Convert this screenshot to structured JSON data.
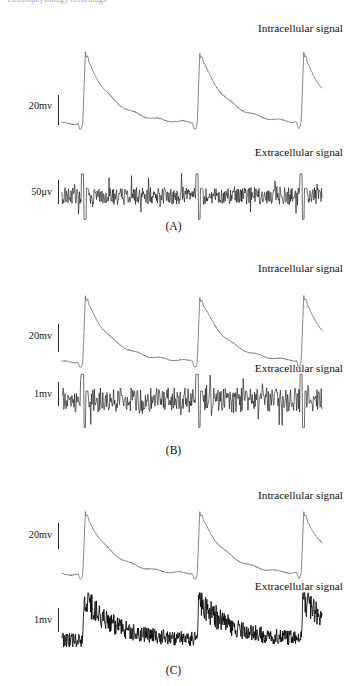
{
  "running_head": "electrophysiology recordings",
  "labels": {
    "intracellular": "Intracellular signal",
    "extracellular": "Extracellular signal"
  },
  "panels": [
    {
      "caption": "(A)",
      "intra": {
        "label": "Intracellular signal",
        "scale": "20mv"
      },
      "extra": {
        "label": "Extracellular signal",
        "scale": "50μv",
        "style": "spiky-noise"
      }
    },
    {
      "caption": "(B)",
      "intra": {
        "label": "Intracellular signal",
        "scale": "20mv"
      },
      "extra": {
        "label": "Extracellular signal",
        "scale": "1mv",
        "style": "spiky-noise"
      }
    },
    {
      "caption": "(C)",
      "intra": {
        "label": "Intracellular signal",
        "scale": "20mv"
      },
      "extra": {
        "label": "Extracellular signal",
        "scale": "1mv",
        "style": "burst-envelope"
      }
    }
  ],
  "chart_data": {
    "type": "line",
    "title": "",
    "xlabel": "",
    "ylabel": "",
    "grid": false,
    "legend": "none",
    "series": [
      {
        "name": "A-intracellular",
        "panel": "A",
        "kind": "intracellular",
        "scale_bar": "20mv",
        "burst_onsets_pct": [
          8,
          52,
          92
        ],
        "peak_amplitude_rel": 1.0,
        "baseline_rel": 0.0,
        "decay_shape": "exponential"
      },
      {
        "name": "A-extracellular",
        "panel": "A",
        "kind": "extracellular",
        "scale_bar": "50μv",
        "spike_positions_pct": [
          8,
          52,
          92
        ],
        "noise_amplitude_rel": 0.18,
        "spike_amplitude_rel": 1.0
      },
      {
        "name": "B-intracellular",
        "panel": "B",
        "kind": "intracellular",
        "scale_bar": "20mv",
        "burst_onsets_pct": [
          8,
          52,
          92
        ],
        "peak_amplitude_rel": 1.0,
        "baseline_rel": 0.0,
        "decay_shape": "exponential"
      },
      {
        "name": "B-extracellular",
        "panel": "B",
        "kind": "extracellular",
        "scale_bar": "1mv",
        "spike_positions_pct": [
          8,
          52,
          92
        ],
        "noise_amplitude_rel": 0.22,
        "spike_amplitude_rel": 1.0
      },
      {
        "name": "C-intracellular",
        "panel": "C",
        "kind": "intracellular",
        "scale_bar": "20mv",
        "burst_onsets_pct": [
          8,
          52,
          92
        ],
        "peak_amplitude_rel": 1.0,
        "baseline_rel": 0.0,
        "decay_shape": "exponential"
      },
      {
        "name": "C-extracellular",
        "panel": "C",
        "kind": "extracellular",
        "scale_bar": "1mv",
        "burst_onsets_pct": [
          8,
          52,
          92
        ],
        "noise_amplitude_rel": 0.12,
        "peak_amplitude_rel": 1.0,
        "decay_shape": "exponential"
      }
    ]
  },
  "geometry": {
    "trace_left": 62,
    "trace_right": 322,
    "panels": [
      {
        "intra": {
          "top": 48,
          "height": 82,
          "label_y": 22,
          "scale_y": 100,
          "bar_y": 95,
          "bar_h": 30
        },
        "extra": {
          "top": 178,
          "height": 38,
          "label_y": 146,
          "scale_y": 186,
          "bar_y": 180,
          "bar_h": 24
        },
        "caption_y": 220
      },
      {
        "intra": {
          "top": 292,
          "height": 76,
          "label_y": 262,
          "scale_y": 330,
          "bar_y": 324,
          "bar_h": 28
        },
        "extra": {
          "top": 378,
          "height": 40,
          "label_y": 362,
          "scale_y": 388,
          "bar_y": 382,
          "bar_h": 24
        },
        "caption_y": 444
      },
      {
        "intra": {
          "top": 508,
          "height": 72,
          "label_y": 489,
          "scale_y": 529,
          "bar_y": 523,
          "bar_h": 26
        },
        "extra": {
          "top": 592,
          "height": 56,
          "label_y": 580,
          "scale_y": 614,
          "bar_y": 608,
          "bar_h": 24
        },
        "caption_y": 664
      }
    ]
  }
}
